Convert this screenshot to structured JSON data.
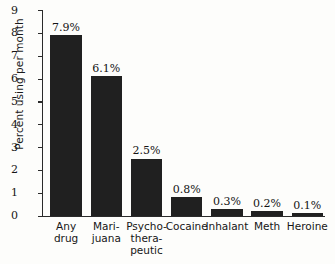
{
  "chart_data": {
    "type": "bar",
    "title": "",
    "subtitle": "",
    "xlabel": "",
    "ylabel": "Percent using per month",
    "categories": [
      "Any drug",
      "Mari-juana",
      "Psycho-thera-peutic",
      "Cocaine",
      "Inhalant",
      "Meth",
      "Heroine"
    ],
    "category_display": [
      "Any\ndrug",
      "Mari-\njuana",
      "Psycho-\nthera-\npeutic",
      "Cocaine",
      "Inhalant",
      "Meth",
      "Heroine"
    ],
    "values": [
      7.9,
      6.1,
      2.5,
      0.8,
      0.3,
      0.2,
      0.1
    ],
    "data_labels": [
      "7.9%",
      "6.1%",
      "2.5%",
      "0.8%",
      "0.3%",
      "0.2%",
      "0.1%"
    ],
    "ylim": [
      0,
      9
    ],
    "ytick_labels": [
      "0",
      "1",
      "2",
      "3",
      "4",
      "5",
      "6",
      "7",
      "8",
      "9"
    ],
    "ytick_values": [
      0,
      1,
      2,
      3,
      4,
      5,
      6,
      7,
      8,
      9
    ],
    "grid": false,
    "legend": null,
    "bar_color": "#202020",
    "axis_color": "#2a2a2a",
    "background_color": "#fdfdfb",
    "text_color": "#151515"
  }
}
